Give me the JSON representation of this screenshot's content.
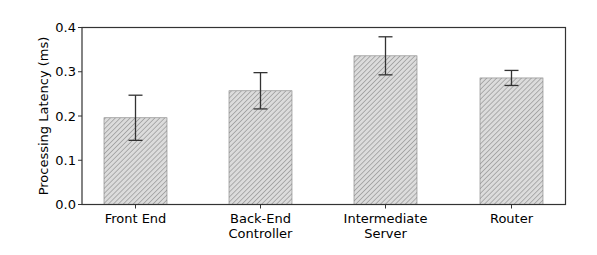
{
  "chart_data": {
    "type": "bar",
    "title": "",
    "xlabel": "",
    "ylabel": "Processing Latency (ms)",
    "ylim": [
      0.0,
      0.4
    ],
    "yticks": [
      "0.0",
      "0.1",
      "0.2",
      "0.3",
      "0.4"
    ],
    "grid": false,
    "legend": null,
    "categories": [
      [
        "Front End"
      ],
      [
        "Back-End",
        "Controller"
      ],
      [
        "Intermediate",
        "Server"
      ],
      [
        "Router"
      ]
    ],
    "category_names": [
      "Front End",
      "Back-End Controller",
      "Intermediate Server",
      "Router"
    ],
    "values": [
      0.196,
      0.257,
      0.336,
      0.286
    ],
    "error": [
      0.051,
      0.041,
      0.043,
      0.017
    ],
    "bar_style": {
      "hatch": "////",
      "fill": "#d9d9d9",
      "hatch_color": "#8a8a8a",
      "edge": "#7f7f7f"
    },
    "axis_color": "#333333"
  }
}
